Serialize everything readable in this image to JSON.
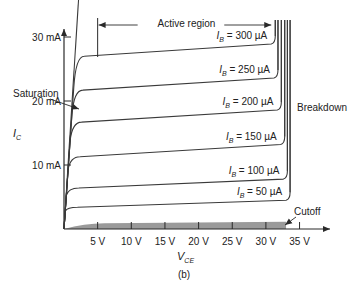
{
  "chart_data": {
    "type": "line",
    "title": "",
    "caption": "(b)",
    "xlabel": "V",
    "xlabel_sub": "CE",
    "ylabel": "I",
    "ylabel_sub": "C",
    "xlim": [
      0,
      37
    ],
    "ylim": [
      0,
      35
    ],
    "x_unit": "V",
    "y_unit": "mA",
    "x_ticks": [
      5,
      10,
      15,
      20,
      25,
      30,
      35
    ],
    "x_tick_labels": [
      "5 V",
      "10 V",
      "15 V",
      "20 V",
      "25 V",
      "30 V",
      "35 V"
    ],
    "y_ticks": [
      10,
      20,
      30
    ],
    "y_tick_labels": [
      "10 mA",
      "20 mA",
      "30 mA"
    ],
    "grid": false,
    "series": [
      {
        "name": "I_B = 300 µA",
        "label_main": "I",
        "label_sub": "B",
        "label_rest": " = 300 µA",
        "ib_uA": 300,
        "knee_v": 2.0,
        "ic_start_mA": 27.0,
        "ic_end_mA": 28.9,
        "breakdown_v": 30.8
      },
      {
        "name": "I_B = 250 µA",
        "label_main": "I",
        "label_sub": "B",
        "label_rest": " = 250 µA",
        "ib_uA": 250,
        "knee_v": 1.8,
        "ic_start_mA": 21.7,
        "ic_end_mA": 23.6,
        "breakdown_v": 31.2
      },
      {
        "name": "I_B = 200 µA",
        "label_main": "I",
        "label_sub": "B",
        "label_rest": " = 200 µA",
        "ib_uA": 200,
        "knee_v": 1.6,
        "ic_start_mA": 16.7,
        "ic_end_mA": 18.6,
        "breakdown_v": 31.7
      },
      {
        "name": "I_B = 150 µA",
        "label_main": "I",
        "label_sub": "B",
        "label_rest": " = 150 µA",
        "ib_uA": 150,
        "knee_v": 1.4,
        "ic_start_mA": 11.3,
        "ic_end_mA": 13.2,
        "breakdown_v": 32.2
      },
      {
        "name": "I_B = 100 µA",
        "label_main": "I",
        "label_sub": "B",
        "label_rest": " = 100 µA",
        "ib_uA": 100,
        "knee_v": 1.2,
        "ic_start_mA": 6.4,
        "ic_end_mA": 7.8,
        "breakdown_v": 32.6
      },
      {
        "name": "I_B = 50 µA",
        "label_main": "I",
        "label_sub": "B",
        "label_rest": " = 50 µA",
        "ib_uA": 50,
        "knee_v": 1.0,
        "ic_start_mA": 3.4,
        "ic_end_mA": 4.5,
        "breakdown_v": 33.0
      }
    ],
    "saturation_line": {
      "v_start": 0,
      "ic_start_mA": 0,
      "v_end": 2.3,
      "ic_end_mA": 35
    },
    "cutoff_region": {
      "v_end": 33.0,
      "ic_max_mA": 1.0,
      "fill": "#9a9a9a"
    },
    "annotations": {
      "active_region": "Active region",
      "saturation": "Saturation",
      "breakdown": "Breakdown",
      "cutoff": "Cutoff"
    },
    "active_region_span_v": [
      5.0,
      30.5
    ],
    "colors": {
      "line": "#3a3a3a",
      "text": "#222222",
      "cutoff_fill": "#9a9a9a"
    }
  }
}
